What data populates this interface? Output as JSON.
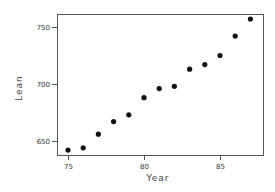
{
  "chart_data": {
    "type": "scatter",
    "title": "",
    "xlabel": "Year",
    "ylabel": "Lean",
    "xlim": [
      74.6,
      87.7
    ],
    "ylim": [
      637,
      762
    ],
    "xticks": [
      75,
      80,
      85
    ],
    "yticks": [
      650,
      700,
      750
    ],
    "grid": false,
    "legend": null,
    "x": [
      75,
      76,
      77,
      78,
      79,
      80,
      81,
      82,
      83,
      84,
      85,
      86,
      87
    ],
    "y": [
      642,
      644,
      656,
      667,
      673,
      688,
      696,
      698,
      713,
      717,
      725,
      742,
      757
    ],
    "marker_color": "#111111"
  },
  "plot_box": {
    "left": 57,
    "top": 14,
    "right": 263,
    "bottom": 155
  }
}
